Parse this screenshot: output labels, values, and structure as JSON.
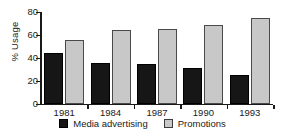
{
  "chart_data": {
    "type": "bar",
    "title": "",
    "xlabel": "",
    "ylabel": "% Usage",
    "ylim": [
      0,
      80
    ],
    "yticks": [
      0,
      20,
      40,
      60,
      80
    ],
    "grid": false,
    "legend_position": "bottom",
    "categories": [
      "1981",
      "1984",
      "1987",
      "1990",
      "1993"
    ],
    "series": [
      {
        "name": "Media advertising",
        "color": "#161616",
        "values": [
          44,
          36,
          35,
          31,
          25
        ]
      },
      {
        "name": "Promotions",
        "color": "#c8c8c8",
        "values": [
          56,
          64,
          65,
          69,
          75
        ]
      }
    ]
  },
  "legend": {
    "items": [
      {
        "label": "Media advertising",
        "swatch": "dark-square-swatch"
      },
      {
        "label": "Promotions",
        "swatch": "light-square-swatch"
      }
    ]
  }
}
